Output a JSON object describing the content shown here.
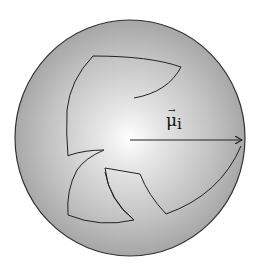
{
  "diagram": {
    "type": "sphere-with-vector",
    "sphere": {
      "cx": 130,
      "cy": 138,
      "rx": 115,
      "ry": 118,
      "center_color": "#ffffff",
      "edge_color": "#9a9a9a",
      "stroke": "#333333"
    },
    "vector": {
      "label_base": "μ",
      "label_sub": "i",
      "label_arrow": "→",
      "from": [
        130,
        140
      ],
      "to": [
        243,
        140
      ]
    },
    "regions": [
      {
        "name": "upper-hook-region"
      },
      {
        "name": "lower-left-region"
      },
      {
        "name": "lower-right-region"
      }
    ]
  }
}
